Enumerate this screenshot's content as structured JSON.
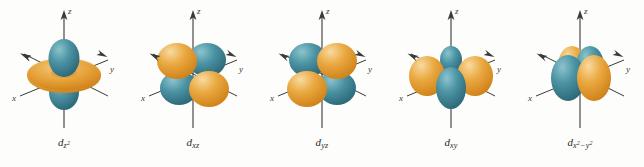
{
  "figure": {
    "background_color": "#fdfdfb",
    "lobe_colors": {
      "teal": "#3d8c9c",
      "teal_light": "#6fb3bd",
      "teal_dark": "#2b6b7a",
      "orange": "#e8a33d",
      "orange_light": "#f3c978",
      "orange_dark": "#d3871f"
    },
    "axis_color": "#3a3a3a",
    "axis_labels": {
      "x": "x",
      "y": "y",
      "z": "z"
    }
  },
  "orbitals": [
    {
      "id": "dz2",
      "label_base": "d",
      "label_sub": "z",
      "label_sup": "2",
      "shape": "dz2",
      "description": "d z-squared orbital: two teal lobes along z axis with orange torus in xy plane"
    },
    {
      "id": "dxz",
      "label_base": "d",
      "label_sub": "xz",
      "label_sup": "",
      "shape": "cloverleaf-vertical",
      "description": "d xz orbital: four lobes in xz plane, orange upper-left and lower-right, teal upper-right and lower-left"
    },
    {
      "id": "dyz",
      "label_base": "d",
      "label_sub": "yz",
      "label_sup": "",
      "shape": "cloverleaf-vertical-alt",
      "description": "d yz orbital: four lobes in yz plane, teal upper-left and lower-right, orange upper-right and lower-left"
    },
    {
      "id": "dxy",
      "label_base": "d",
      "label_sub": "xy",
      "label_sup": "",
      "shape": "cloverleaf-horizontal",
      "description": "d xy orbital: four lobes in xy plane, orange left and right, teal front and back"
    },
    {
      "id": "dx2y2",
      "label_base": "d",
      "label_sub": "x",
      "label_sup": "2",
      "label_sub2": "−y",
      "label_sup2": "2",
      "shape": "x2-y2",
      "description": "d x-squared minus y-squared orbital: teal lobes along x axis, orange lobes along y axis"
    }
  ]
}
